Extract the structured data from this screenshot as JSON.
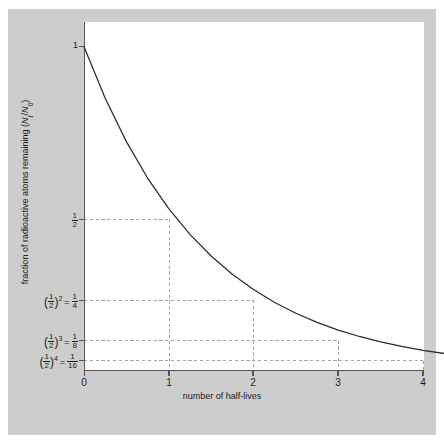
{
  "figure": {
    "background_color": "#cdcdcd",
    "plot_background_color": "#ffffff",
    "axis_color": "#555555",
    "curve_color": "#2b2b2b",
    "grid_color": "#9a9a9a"
  },
  "chart_data": {
    "type": "line",
    "title": "",
    "xlabel": "number of half-lives",
    "ylabel": "fraction of radioactive atoms remaining (Nt/N0)",
    "ylabel_parts": {
      "text_before": "fraction of radioactive atoms remaining (",
      "n_symbol": "N",
      "sub_t": "t",
      "slash": "/",
      "n_symbol2": "N",
      "sub_0": "0",
      "text_after": ")"
    },
    "xlim": [
      0,
      4.3
    ],
    "ylim": [
      0,
      1.08
    ],
    "grid": true,
    "grid_style": "dashed-stepped",
    "legend": null,
    "x_ticks": [
      "0",
      "1",
      "2",
      "3",
      "4"
    ],
    "x_tick_values": [
      0,
      1,
      2,
      3,
      4
    ],
    "y_ticks": [
      {
        "label": "1",
        "value": 1,
        "kind": "plain"
      },
      {
        "label": "1/2",
        "value": 0.5,
        "kind": "fraction",
        "num": "1",
        "den": "2"
      },
      {
        "label": "(1/2)^2 = 1/4",
        "value": 0.25,
        "kind": "power",
        "base_num": "1",
        "base_den": "2",
        "exponent": "2",
        "result_num": "1",
        "result_den": "4"
      },
      {
        "label": "(1/2)^3 = 1/8",
        "value": 0.125,
        "kind": "power",
        "base_num": "1",
        "base_den": "2",
        "exponent": "3",
        "result_num": "1",
        "result_den": "8"
      },
      {
        "label": "(1/2)^4 = 1/16",
        "value": 0.0625,
        "kind": "power",
        "base_num": "1",
        "base_den": "2",
        "exponent": "4",
        "result_num": "1",
        "result_den": "16"
      }
    ],
    "series": [
      {
        "name": "exponential decay",
        "formula": "N/N0 = (1/2)^t",
        "x": [
          0,
          0.25,
          0.5,
          0.75,
          1,
          1.25,
          1.5,
          1.75,
          2,
          2.25,
          2.5,
          2.75,
          3,
          3.25,
          3.5,
          3.75,
          4,
          4.3
        ],
        "values": [
          1,
          0.8409,
          0.7071,
          0.5946,
          0.5,
          0.4204,
          0.3536,
          0.2973,
          0.25,
          0.2102,
          0.1768,
          0.1487,
          0.125,
          0.1051,
          0.0884,
          0.0743,
          0.0625,
          0.0508
        ]
      }
    ],
    "annotations": [
      {
        "kind": "gridline-h",
        "y": 0.5,
        "x_end": 1
      },
      {
        "kind": "gridline-h",
        "y": 0.25,
        "x_end": 2
      },
      {
        "kind": "gridline-h",
        "y": 0.125,
        "x_end": 3
      },
      {
        "kind": "gridline-h",
        "y": 0.0625,
        "x_end": 4
      },
      {
        "kind": "gridline-v",
        "x": 1,
        "y_top": 0.5
      },
      {
        "kind": "gridline-v",
        "x": 2,
        "y_top": 0.25
      },
      {
        "kind": "gridline-v",
        "x": 3,
        "y_top": 0.125
      },
      {
        "kind": "gridline-v",
        "x": 4,
        "y_top": 0.0625
      }
    ]
  }
}
